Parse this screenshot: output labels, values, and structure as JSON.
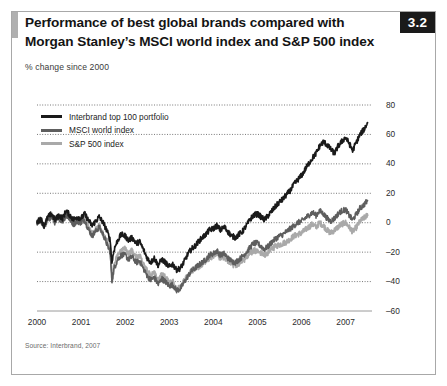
{
  "figure": {
    "badge": "3.2",
    "title_line1": "Performance of best global brands compared with",
    "title_line2": "Morgan Stanley’s MSCI world index and S&P 500 index",
    "subtitle": "% change since 2000",
    "source": "Source: Interbrand, 2007"
  },
  "colors": {
    "interbrand": "#1a1a1a",
    "msci": "#5e5e5e",
    "sp500": "#a9a9a9",
    "gridline": "#555555",
    "axis": "#9a9a9a",
    "frame": "#a8a8a8",
    "badge_bg": "#1a1a1a",
    "badge_text": "#ffffff",
    "accent_bar": "#b0b0b0"
  },
  "chart_data": {
    "type": "line",
    "title": "Performance of best global brands compared with Morgan Stanley’s MSCI world index and S&P 500 index",
    "subtitle": "% change since 2000",
    "xlabel": "",
    "ylabel": "% change since 2000",
    "xlim": [
      2000,
      2007.6
    ],
    "ylim": [
      -60,
      80
    ],
    "yticks": [
      80,
      60,
      40,
      20,
      0,
      -20,
      -40,
      -60
    ],
    "ytick_labels": [
      "80",
      "60",
      "40",
      "20",
      "0",
      "–20",
      "–40",
      "–60"
    ],
    "xticks": [
      2000,
      2001,
      2002,
      2003,
      2004,
      2005,
      2006,
      2007
    ],
    "xtick_labels": [
      "2000",
      "2001",
      "2002",
      "2003",
      "2004",
      "2005",
      "2006",
      "2007"
    ],
    "grid": "horizontal-dotted",
    "legend_position": "top-left",
    "legend": [
      "Interbrand top 100 portfolio",
      "MSCI world index",
      "S&P 500 index"
    ],
    "series": [
      {
        "name": "Interbrand top 100 portfolio",
        "color": "#1a1a1a",
        "x": [
          2000.0,
          2000.08,
          2000.16,
          2000.25,
          2000.33,
          2000.41,
          2000.5,
          2000.58,
          2000.66,
          2000.75,
          2000.83,
          2000.91,
          2001.0,
          2001.08,
          2001.16,
          2001.25,
          2001.33,
          2001.41,
          2001.5,
          2001.58,
          2001.66,
          2001.7,
          2001.75,
          2001.83,
          2001.91,
          2002.0,
          2002.08,
          2002.16,
          2002.25,
          2002.33,
          2002.41,
          2002.5,
          2002.58,
          2002.66,
          2002.75,
          2002.83,
          2002.91,
          2003.0,
          2003.08,
          2003.16,
          2003.25,
          2003.33,
          2003.41,
          2003.5,
          2003.58,
          2003.66,
          2003.75,
          2003.83,
          2003.91,
          2004.0,
          2004.08,
          2004.16,
          2004.25,
          2004.33,
          2004.41,
          2004.5,
          2004.58,
          2004.66,
          2004.75,
          2004.83,
          2004.91,
          2005.0,
          2005.08,
          2005.16,
          2005.25,
          2005.33,
          2005.41,
          2005.5,
          2005.58,
          2005.66,
          2005.75,
          2005.83,
          2005.91,
          2006.0,
          2006.08,
          2006.16,
          2006.25,
          2006.33,
          2006.41,
          2006.5,
          2006.58,
          2006.66,
          2006.75,
          2006.83,
          2006.91,
          2007.0,
          2007.08,
          2007.16,
          2007.25,
          2007.33,
          2007.41,
          2007.5
        ],
        "y": [
          0,
          3,
          -2,
          4,
          6,
          2,
          5,
          3,
          8,
          5,
          2,
          4,
          3,
          6,
          2,
          -2,
          1,
          4,
          0,
          -5,
          -12,
          -27,
          -18,
          -12,
          -8,
          -9,
          -12,
          -10,
          -14,
          -13,
          -18,
          -24,
          -27,
          -24,
          -29,
          -25,
          -27,
          -30,
          -28,
          -32,
          -31,
          -27,
          -22,
          -18,
          -16,
          -13,
          -10,
          -8,
          -5,
          -4,
          -2,
          -5,
          -3,
          -6,
          -9,
          -10,
          -8,
          -6,
          -2,
          2,
          5,
          6,
          4,
          2,
          5,
          8,
          11,
          14,
          16,
          19,
          22,
          26,
          29,
          32,
          36,
          40,
          44,
          47,
          52,
          55,
          53,
          50,
          47,
          52,
          55,
          58,
          54,
          49,
          55,
          60,
          63,
          68
        ]
      },
      {
        "name": "MSCI world index",
        "color": "#5e5e5e",
        "x": [
          2000.0,
          2000.08,
          2000.16,
          2000.25,
          2000.33,
          2000.41,
          2000.5,
          2000.58,
          2000.66,
          2000.75,
          2000.83,
          2000.91,
          2001.0,
          2001.08,
          2001.16,
          2001.25,
          2001.33,
          2001.41,
          2001.5,
          2001.58,
          2001.66,
          2001.7,
          2001.75,
          2001.83,
          2001.91,
          2002.0,
          2002.08,
          2002.16,
          2002.25,
          2002.33,
          2002.41,
          2002.5,
          2002.58,
          2002.66,
          2002.75,
          2002.83,
          2002.91,
          2003.0,
          2003.08,
          2003.16,
          2003.25,
          2003.33,
          2003.41,
          2003.5,
          2003.58,
          2003.66,
          2003.75,
          2003.83,
          2003.91,
          2004.0,
          2004.08,
          2004.16,
          2004.25,
          2004.33,
          2004.41,
          2004.5,
          2004.58,
          2004.66,
          2004.75,
          2004.83,
          2004.91,
          2005.0,
          2005.08,
          2005.16,
          2005.25,
          2005.33,
          2005.41,
          2005.5,
          2005.58,
          2005.66,
          2005.75,
          2005.83,
          2005.91,
          2006.0,
          2006.08,
          2006.16,
          2006.25,
          2006.33,
          2006.41,
          2006.5,
          2006.58,
          2006.66,
          2006.75,
          2006.83,
          2006.91,
          2007.0,
          2007.08,
          2007.16,
          2007.25,
          2007.33,
          2007.41,
          2007.5
        ],
        "y": [
          0,
          2,
          -3,
          2,
          4,
          0,
          3,
          1,
          5,
          2,
          -1,
          1,
          0,
          2,
          -4,
          -9,
          -6,
          -3,
          -8,
          -14,
          -20,
          -40,
          -31,
          -25,
          -22,
          -22,
          -25,
          -23,
          -27,
          -26,
          -31,
          -36,
          -39,
          -37,
          -42,
          -38,
          -40,
          -43,
          -42,
          -46,
          -45,
          -41,
          -37,
          -33,
          -31,
          -29,
          -27,
          -25,
          -22,
          -21,
          -19,
          -22,
          -21,
          -24,
          -26,
          -27,
          -25,
          -23,
          -20,
          -17,
          -14,
          -14,
          -16,
          -18,
          -16,
          -13,
          -11,
          -9,
          -8,
          -6,
          -4,
          -2,
          0,
          1,
          3,
          5,
          7,
          5,
          8,
          6,
          3,
          1,
          3,
          6,
          8,
          9,
          5,
          2,
          6,
          10,
          12,
          15
        ]
      },
      {
        "name": "S&P 500 index",
        "color": "#a9a9a9",
        "x": [
          2000.0,
          2000.08,
          2000.16,
          2000.25,
          2000.33,
          2000.41,
          2000.5,
          2000.58,
          2000.66,
          2000.75,
          2000.83,
          2000.91,
          2001.0,
          2001.08,
          2001.16,
          2001.25,
          2001.33,
          2001.41,
          2001.5,
          2001.58,
          2001.66,
          2001.7,
          2001.75,
          2001.83,
          2001.91,
          2002.0,
          2002.08,
          2002.16,
          2002.25,
          2002.33,
          2002.41,
          2002.5,
          2002.58,
          2002.66,
          2002.75,
          2002.83,
          2002.91,
          2003.0,
          2003.08,
          2003.16,
          2003.25,
          2003.33,
          2003.41,
          2003.5,
          2003.58,
          2003.66,
          2003.75,
          2003.83,
          2003.91,
          2004.0,
          2004.08,
          2004.16,
          2004.25,
          2004.33,
          2004.41,
          2004.5,
          2004.58,
          2004.66,
          2004.75,
          2004.83,
          2004.91,
          2005.0,
          2005.08,
          2005.16,
          2005.25,
          2005.33,
          2005.41,
          2005.5,
          2005.58,
          2005.66,
          2005.75,
          2005.83,
          2005.91,
          2006.0,
          2006.08,
          2006.16,
          2006.25,
          2006.33,
          2006.41,
          2006.5,
          2006.58,
          2006.66,
          2006.75,
          2006.83,
          2006.91,
          2007.0,
          2007.08,
          2007.16,
          2007.25,
          2007.33,
          2007.41,
          2007.5
        ],
        "y": [
          0,
          2,
          -2,
          3,
          5,
          1,
          4,
          2,
          6,
          3,
          0,
          2,
          1,
          3,
          -3,
          -8,
          -5,
          -2,
          -7,
          -12,
          -18,
          -38,
          -28,
          -22,
          -18,
          -18,
          -21,
          -19,
          -24,
          -22,
          -28,
          -33,
          -36,
          -34,
          -40,
          -35,
          -37,
          -41,
          -40,
          -45,
          -44,
          -40,
          -36,
          -33,
          -31,
          -30,
          -28,
          -26,
          -24,
          -23,
          -21,
          -24,
          -23,
          -26,
          -28,
          -29,
          -28,
          -26,
          -24,
          -21,
          -19,
          -19,
          -21,
          -22,
          -20,
          -18,
          -16,
          -15,
          -14,
          -13,
          -11,
          -9,
          -8,
          -7,
          -5,
          -3,
          -1,
          -3,
          0,
          -2,
          -5,
          -7,
          -5,
          -3,
          -1,
          0,
          -3,
          -6,
          -3,
          1,
          3,
          5
        ]
      }
    ]
  }
}
